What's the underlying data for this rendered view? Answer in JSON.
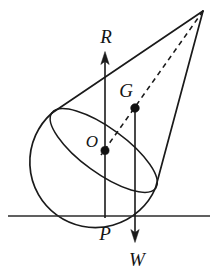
{
  "figure": {
    "kind": "physics-free-body-diagram",
    "colors": {
      "ink": "#1a1a1a",
      "background": "#ffffff",
      "ground": "#2b2b2b",
      "dot": "#111111"
    },
    "labels": {
      "reaction": "R",
      "weight": "W",
      "centre_of_gravity": "G",
      "centre_of_sphere": "O",
      "contact_point": "P"
    },
    "label_positions": {
      "reaction": {
        "x": 106,
        "y": 43
      },
      "weight": {
        "x": 137,
        "y": 265
      },
      "centre_of_gravity": {
        "x": 126,
        "y": 97
      },
      "centre_of_sphere": {
        "x": 92,
        "y": 147
      },
      "contact_point": {
        "x": 105,
        "y": 240
      }
    },
    "points": {
      "apex": {
        "x": 203,
        "y": 11
      },
      "rim_left": {
        "x": 52,
        "y": 113
      },
      "rim_right": {
        "x": 155.5,
        "y": 188
      },
      "centre_of_sphere": {
        "x": 105,
        "y": 150.5
      },
      "centre_of_gravity": {
        "x": 135,
        "y": 108
      },
      "contact_point": {
        "x": 105,
        "y": 216
      }
    },
    "ground_line": {
      "x1": 8,
      "x2": 210,
      "y": 216
    },
    "reaction_vector": {
      "x": 105,
      "y_tail": 218,
      "y_tip": 52
    },
    "weight_vector": {
      "x": 135,
      "y_tail": 108,
      "y_tip": 242
    },
    "axis_dashed": {
      "x1": 203,
      "y1": 11,
      "x2": 101,
      "y2": 155
    },
    "ellipse_rim": {
      "cx": 103.75,
      "cy": 150.5,
      "rx": 64.1,
      "ry": 22.5,
      "rotation_deg": 36.0
    },
    "hemisphere": {
      "cx": 105,
      "cy": 150.5,
      "r": 65.5
    }
  }
}
